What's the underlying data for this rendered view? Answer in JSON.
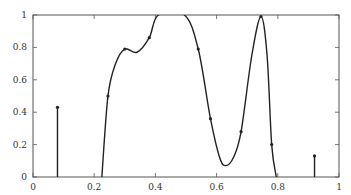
{
  "chart_data": {
    "type": "line",
    "title": "",
    "xlabel": "",
    "ylabel": "",
    "xlim": [
      0,
      1
    ],
    "ylim": [
      0,
      1
    ],
    "grid": false,
    "legend": null,
    "x_ticks": [
      "0",
      "0.2",
      "0.4",
      "0.6",
      "0.8",
      "1"
    ],
    "y_ticks": [
      "0",
      "0.2",
      "0.4",
      "0.6",
      "0.8",
      "1"
    ],
    "series": [
      {
        "name": "curve",
        "style": "smooth line with point markers, clipped at y=1",
        "curve_points": [
          [
            0.225,
            0.0
          ],
          [
            0.245,
            0.5
          ],
          [
            0.27,
            0.7
          ],
          [
            0.3,
            0.79
          ],
          [
            0.34,
            0.77
          ],
          [
            0.38,
            0.86
          ],
          [
            0.41,
            1.0
          ],
          [
            0.495,
            1.0
          ],
          [
            0.54,
            0.79
          ],
          [
            0.58,
            0.36
          ],
          [
            0.61,
            0.12
          ],
          [
            0.63,
            0.07
          ],
          [
            0.655,
            0.12
          ],
          [
            0.68,
            0.28
          ],
          [
            0.715,
            0.75
          ],
          [
            0.745,
            0.99
          ],
          [
            0.765,
            0.75
          ],
          [
            0.78,
            0.2
          ],
          [
            0.795,
            0.0
          ]
        ],
        "markers": [
          [
            0.245,
            0.5
          ],
          [
            0.3,
            0.79
          ],
          [
            0.38,
            0.86
          ],
          [
            0.54,
            0.79
          ],
          [
            0.58,
            0.36
          ],
          [
            0.68,
            0.28
          ],
          [
            0.745,
            0.99
          ],
          [
            0.78,
            0.2
          ]
        ]
      },
      {
        "name": "stems",
        "style": "vertical stem with marker",
        "points": [
          [
            0.08,
            0.43
          ],
          [
            0.92,
            0.13
          ]
        ]
      }
    ],
    "colors": {
      "line": "#222222",
      "axis": "#555555"
    }
  },
  "plot_box": {
    "left": 33,
    "top": 15,
    "right": 339,
    "bottom": 177
  }
}
